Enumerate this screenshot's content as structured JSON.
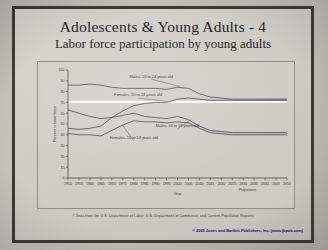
{
  "slide": {
    "title": "Adolescents & Young Adults - 4",
    "subtitle": "Labor force participation by young adults",
    "source_note": "© Data from the U.S. Department of Labor, U.S. Department of Commerce, and Current Population Reports",
    "copyright": "© 2005 Jones and Bartlett Publishers, Inc. (www.jbpub.com)"
  },
  "chart_data": {
    "type": "line",
    "title": "Labor force participation by young adults",
    "xlabel": "Year",
    "ylabel": "Percent in labor force",
    "xlim": [
      1950,
      2050
    ],
    "ylim": [
      0,
      100
    ],
    "grid": false,
    "legend_position": "inline-annotations",
    "annotations": [
      "Projections"
    ],
    "projection_start": 2005,
    "categories": [
      1950,
      1955,
      1960,
      1965,
      1970,
      1975,
      1980,
      1985,
      1990,
      1995,
      2000,
      2005,
      2010,
      2015,
      2020,
      2025,
      2030,
      2035,
      2040,
      2045,
      2050
    ],
    "xticks": [
      "1950",
      "1955",
      "1960",
      "1965",
      "1970",
      "1975",
      "1980",
      "1985",
      "1990",
      "1995",
      "2000",
      "2005",
      "2010",
      "2015",
      "2020",
      "2025",
      "2030",
      "2035",
      "2040",
      "2045",
      "2050"
    ],
    "yticks": [
      "0",
      "10",
      "20",
      "30",
      "40",
      "50",
      "60",
      "70",
      "80",
      "90",
      "100"
    ],
    "series": [
      {
        "name": "Males, 20 to 24 years old",
        "values": [
          86,
          86,
          87,
          86,
          84,
          83,
          83,
          83,
          83,
          82,
          84,
          83,
          78,
          75,
          74,
          73,
          73,
          73,
          73,
          73,
          73
        ]
      },
      {
        "name": "Females, 20 to 24 years old",
        "values": [
          46,
          45,
          46,
          48,
          56,
          62,
          67,
          69,
          70,
          70,
          73,
          74,
          73,
          72,
          72,
          72,
          72,
          72,
          72,
          72,
          72
        ]
      },
      {
        "name": "Males, 16 to 19 years old",
        "values": [
          63,
          60,
          57,
          55,
          56,
          58,
          60,
          57,
          56,
          55,
          57,
          54,
          48,
          44,
          43,
          42,
          42,
          42,
          42,
          42,
          42
        ]
      },
      {
        "name": "Females, 16 to 19 years old",
        "values": [
          41,
          40,
          40,
          39,
          44,
          49,
          53,
          52,
          52,
          51,
          52,
          51,
          46,
          42,
          41,
          40,
          40,
          40,
          40,
          40,
          40
        ]
      }
    ]
  }
}
